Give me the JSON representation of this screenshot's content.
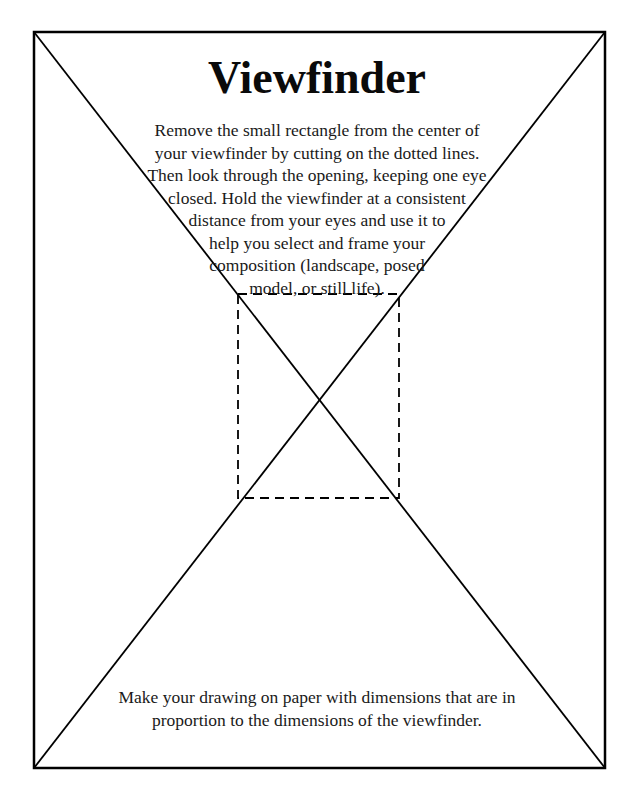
{
  "page": {
    "title": "Viewfinder",
    "instructions": {
      "lines": [
        "Remove the small rectangle from the center of",
        "your viewfinder by cutting on the dotted lines.",
        "Then look through the opening, keeping one eye",
        "closed. Hold the viewfinder at a consistent",
        "distance from your eyes and use it to",
        "help you select and frame your",
        "composition (landscape, posed",
        "model, or still life)."
      ]
    },
    "footer_note": {
      "lines": [
        "Make your drawing on paper with dimensions that are in",
        "proportion to the dimensions of the viewfinder."
      ]
    }
  },
  "figure": {
    "outer_frame": {
      "x1": 34,
      "y1": 32,
      "x2": 605,
      "y2": 768
    },
    "cutout_rectangle": {
      "x1": 238,
      "y1": 294,
      "x2": 399,
      "y2": 498,
      "style": "dashed"
    },
    "diagonals": "corner-to-corner",
    "line_color": "#000000"
  }
}
